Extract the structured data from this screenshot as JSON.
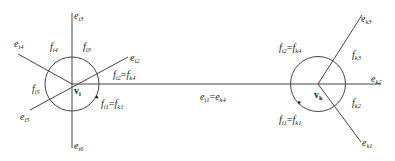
{
  "diagram": {
    "vertices": [
      {
        "id": "vi",
        "label": "v",
        "sub": "i"
      },
      {
        "id": "vk",
        "label": "v",
        "sub": "k"
      }
    ],
    "edges_left": [
      {
        "base": "e",
        "sub": "i3"
      },
      {
        "base": "e",
        "sub": "i4"
      },
      {
        "base": "e",
        "sub": "i2"
      },
      {
        "base": "e",
        "sub": "i5"
      },
      {
        "base": "e",
        "sub": "i6"
      }
    ],
    "faces_left": [
      {
        "base": "f",
        "sub": "i4"
      },
      {
        "base": "f",
        "sub": "i3"
      },
      {
        "base": "f",
        "sub": "i5"
      }
    ],
    "left_eq_top": {
      "a_base": "f",
      "a_sub": "i2",
      "eq": "=",
      "b_base": "f",
      "b_sub": "k4"
    },
    "left_eq_bottom": {
      "a_base": "f",
      "a_sub": "i1",
      "eq": "=",
      "b_base": "f",
      "b_sub": "k1"
    },
    "shared_edge": {
      "a_base": "e",
      "a_sub": "i1",
      "eq": "=",
      "b_base": "e",
      "b_sub": "k4"
    },
    "edges_right": [
      {
        "base": "e",
        "sub": "k3"
      },
      {
        "base": "e",
        "sub": "k2"
      },
      {
        "base": "e",
        "sub": "k1"
      }
    ],
    "faces_right": [
      {
        "base": "f",
        "sub": "k3"
      },
      {
        "base": "f",
        "sub": "k2"
      }
    ],
    "right_eq_top": {
      "a_base": "f",
      "a_sub": "i2",
      "eq": "=",
      "b_base": "f",
      "b_sub": "k4"
    },
    "right_eq_bottom": {
      "a_base": "f",
      "a_sub": "i1",
      "eq": "=",
      "b_base": "f",
      "b_sub": "k1"
    }
  }
}
